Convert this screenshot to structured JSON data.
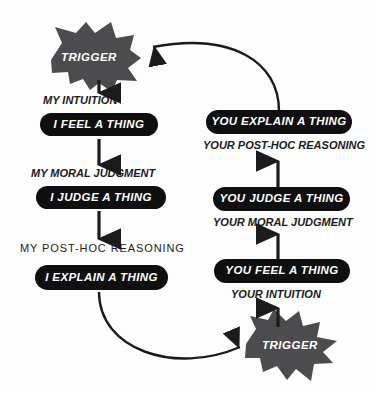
{
  "diagram": {
    "type": "flow-diagram",
    "colors": {
      "background": "#fdfdfd",
      "pill_fill": "#100f10",
      "pill_text": "#ffffff",
      "star_fill": "#4c4b4d",
      "star_text": "#ffffff",
      "caption_text": "#1c1b1c",
      "arrow": "#1c1b1c"
    },
    "left_column": {
      "trigger": {
        "label": "TRIGGER"
      },
      "steps": [
        {
          "caption": "MY INTUITION",
          "pill": "I FEEL A THING"
        },
        {
          "caption": "MY MORAL JUDGMENT",
          "pill": "I JUDGE A THING"
        },
        {
          "caption": "MY POST-HOC REASONING",
          "pill": "I EXPLAIN A THING"
        }
      ]
    },
    "right_column": {
      "trigger": {
        "label": "TRIGGER"
      },
      "steps": [
        {
          "pill": "YOU EXPLAIN A THING",
          "caption": "YOUR POST-HOC REASONING"
        },
        {
          "pill": "YOU JUDGE A THING",
          "caption": "YOUR MORAL JUDGMENT"
        },
        {
          "pill": "YOU FEEL A THING",
          "caption": "YOUR INTUITION"
        }
      ]
    }
  }
}
